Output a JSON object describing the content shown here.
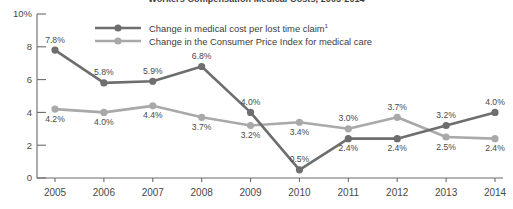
{
  "chart_data": {
    "type": "line",
    "title": "Workers Compensation Medical Costs, 2005-2014",
    "xlabel": "",
    "ylabel": "",
    "ylim": [
      0,
      10
    ],
    "yticks": [
      0,
      2,
      4,
      6,
      8,
      10
    ],
    "ytick_labels": [
      "0",
      "2",
      "4",
      "6",
      "8",
      "10%"
    ],
    "grid": false,
    "legend_position": "top-center",
    "categories": [
      "2005",
      "2006",
      "2007",
      "2008",
      "2009",
      "2010",
      "2011",
      "2012",
      "2013",
      "2014"
    ],
    "series": [
      {
        "name": "Change in medical cost per lost time claim",
        "footnote_marker": "1",
        "color": "#6e6e6e",
        "values": [
          7.8,
          5.8,
          5.9,
          6.8,
          4.0,
          0.5,
          2.4,
          2.4,
          3.2,
          4.0
        ],
        "value_labels": [
          "7.8%",
          "5.8%",
          "5.9%",
          "6.8%",
          "4.0%",
          "0.5%",
          "2.4%",
          "2.4%",
          "3.2%",
          "4.0%"
        ],
        "label_side": [
          "above",
          "above",
          "above",
          "above",
          "above",
          "above",
          "below",
          "below",
          "above",
          "above"
        ]
      },
      {
        "name": "Change in the Consumer Price Index for medical care",
        "footnote_marker": "",
        "color": "#a9a9a9",
        "values": [
          4.2,
          4.0,
          4.4,
          3.7,
          3.2,
          3.4,
          3.0,
          3.7,
          2.5,
          2.4
        ],
        "value_labels": [
          "4.2%",
          "4.0%",
          "4.4%",
          "3.7%",
          "3.2%",
          "3.4%",
          "3.0%",
          "3.7%",
          "2.5%",
          "2.4%"
        ],
        "label_side": [
          "below",
          "below",
          "below",
          "below",
          "below",
          "below",
          "above",
          "above",
          "below",
          "below"
        ]
      }
    ]
  },
  "legend": {
    "items": [
      {
        "label": "Change in medical cost per lost time claim",
        "sup": "1",
        "color": "#6e6e6e"
      },
      {
        "label": "Change in the Consumer Price Index for medical care",
        "sup": "",
        "color": "#a9a9a9"
      }
    ]
  }
}
